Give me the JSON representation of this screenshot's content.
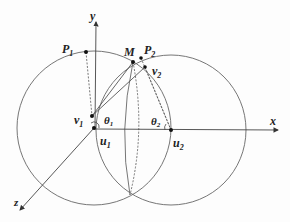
{
  "diagram": {
    "axes": {
      "x": "x",
      "y": "y",
      "z": "z"
    },
    "points": {
      "P1": {
        "label": "P",
        "sub": "1"
      },
      "P2": {
        "label": "P",
        "sub": "2"
      },
      "M": {
        "label": "M"
      },
      "v1": {
        "label": "v",
        "sub": "1"
      },
      "v2": {
        "label": "v",
        "sub": "2"
      },
      "u1": {
        "label": "u",
        "sub": "1"
      },
      "u2": {
        "label": "u",
        "sub": "2"
      }
    },
    "angles": {
      "theta1": {
        "label": "θ",
        "sub": "1"
      },
      "theta2": {
        "label": "θ",
        "sub": "2"
      }
    },
    "colors": {
      "line": "#555555",
      "text": "#222222"
    }
  }
}
